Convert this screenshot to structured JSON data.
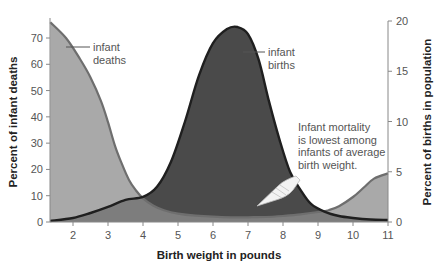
{
  "chart_data": {
    "type": "area",
    "title": "",
    "xlabel": "Birth weight in pounds",
    "ylabel_left": "Percent of infant deaths",
    "ylabel_right": "Percent of births in population",
    "x_ticks": [
      2,
      3,
      4,
      5,
      6,
      7,
      8,
      9,
      10,
      11
    ],
    "xlim": [
      1.35,
      11
    ],
    "y_left_ticks": [
      0,
      10,
      20,
      30,
      40,
      50,
      60,
      70
    ],
    "y_left_lim": [
      0,
      77
    ],
    "y_right_ticks": [
      0,
      5,
      10,
      15,
      20
    ],
    "y_right_lim": [
      0,
      20
    ],
    "grid": false,
    "series": [
      {
        "name": "infant deaths",
        "axis": "left",
        "color": "#a9a9a9",
        "line_color": "#6e6e6e",
        "x": [
          1.35,
          1.8,
          2.2,
          2.5,
          2.8,
          3.0,
          3.2,
          3.4,
          3.6,
          3.8,
          4.0,
          4.3,
          4.6,
          5.0,
          5.5,
          6.0,
          6.5,
          7.0,
          7.5,
          8.0,
          8.5,
          9.0,
          9.3,
          9.6,
          10.0,
          10.3,
          10.6,
          11.0
        ],
        "values": [
          76,
          70,
          62,
          55,
          46,
          38,
          29,
          22,
          16,
          12,
          9,
          6.2,
          4.5,
          3.2,
          2.4,
          2.0,
          1.8,
          1.8,
          1.9,
          2.3,
          2.9,
          3.8,
          4.5,
          6.0,
          9.5,
          13,
          16.5,
          18.5
        ]
      },
      {
        "name": "infant births",
        "axis": "right",
        "color": "#4a4a4a",
        "line_color": "#1f1f1f",
        "x": [
          1.35,
          2.0,
          2.5,
          3.0,
          3.5,
          4.0,
          4.4,
          4.8,
          5.2,
          5.6,
          6.0,
          6.4,
          6.7,
          7.0,
          7.3,
          7.6,
          7.9,
          8.2,
          8.5,
          8.8,
          9.2,
          9.6,
          10.0,
          10.5,
          11.0
        ],
        "values": [
          0.1,
          0.4,
          0.9,
          1.5,
          2.2,
          2.5,
          3.5,
          6.0,
          10.0,
          14.6,
          17.8,
          19.2,
          19.4,
          18.7,
          16.2,
          12.0,
          8.2,
          5.0,
          3.2,
          1.8,
          1.0,
          0.6,
          0.4,
          0.25,
          0.2
        ]
      }
    ],
    "annotations": [
      {
        "label_lines": [
          "infant",
          "deaths"
        ],
        "points_to": "infant deaths"
      },
      {
        "label_lines": [
          "infant",
          "births"
        ],
        "points_to": "infant births"
      },
      {
        "label_lines": [
          "Infant mortality",
          "is lowest among",
          "infants of average",
          "birth weight."
        ],
        "icon": "pointing-hand-icon"
      }
    ]
  },
  "labels": {
    "xlabel": "Birth weight in pounds",
    "ylabel_left": "Percent of infant deaths",
    "ylabel_right": "Percent of births in population"
  }
}
